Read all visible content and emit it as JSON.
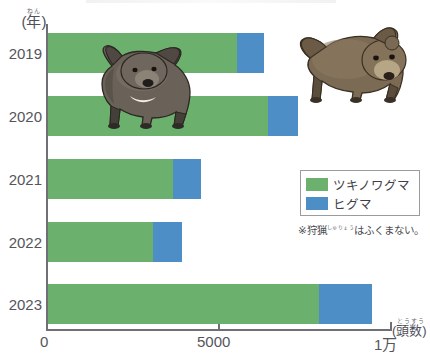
{
  "axes": {
    "y_unit_ruby": "ねん",
    "y_unit_base": "(年)",
    "x_unit_ruby": "とうすう",
    "x_unit_base": "(頭数)",
    "x_ticks": [
      "0",
      "5000",
      "1万"
    ]
  },
  "legend": {
    "items": [
      {
        "label": "ツキノワグマ",
        "color": "#6cb06e",
        "swatch_name": "green-swatch"
      },
      {
        "label": "ヒグマ",
        "color": "#4e8ec6",
        "swatch_name": "blue-swatch"
      }
    ],
    "note_prefix": "※",
    "note_ruby": "しゅりょう",
    "note_kanji": "狩猟",
    "note_suffix": "はふくまない。",
    "note_full": "※狩猟はふくまない。"
  },
  "illustrations": [
    {
      "name": "black-bear-illustration",
      "species": "ツキノワグマ"
    },
    {
      "name": "brown-bear-illustration",
      "species": "ヒグマ"
    }
  ],
  "chart_data": {
    "type": "bar",
    "orientation": "horizontal",
    "stacked": true,
    "title": "",
    "xlabel": "(頭数)",
    "ylabel": "(年)",
    "xlim": [
      0,
      10000
    ],
    "xticks": [
      0,
      5000,
      10000
    ],
    "xtick_labels": [
      "0",
      "5000",
      "1万"
    ],
    "grid": false,
    "legend_position": "right",
    "categories": [
      "2019",
      "2020",
      "2021",
      "2022",
      "2023"
    ],
    "series": [
      {
        "name": "ツキノワグマ",
        "color": "#6cb06e",
        "values": [
          5500,
          6400,
          3650,
          3050,
          7900
        ]
      },
      {
        "name": "ヒグマ",
        "color": "#4e8ec6",
        "values": [
          800,
          900,
          800,
          850,
          1550
        ]
      }
    ],
    "totals": [
      6300,
      7300,
      4450,
      3900,
      9450
    ],
    "annotations": [
      "※狩猟はふくまない。"
    ]
  },
  "bars": [
    {
      "year": "2019",
      "top": 33,
      "green_value": 5500,
      "total_value": 6300
    },
    {
      "year": "2020",
      "top": 96,
      "green_value": 6400,
      "total_value": 7300
    },
    {
      "year": "2021",
      "top": 159,
      "green_value": 3650,
      "total_value": 4450
    },
    {
      "year": "2022",
      "top": 222,
      "green_value": 3050,
      "total_value": 3900
    },
    {
      "year": "2023",
      "top": 284,
      "green_value": 7900,
      "total_value": 9450
    }
  ]
}
